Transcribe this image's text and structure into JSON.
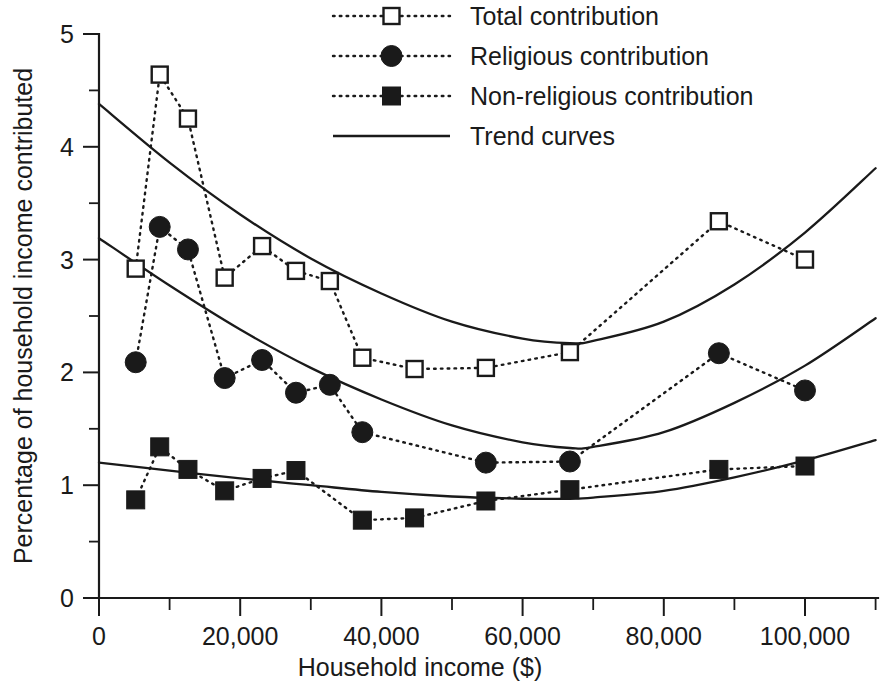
{
  "chart_data": {
    "type": "scatter",
    "title": "",
    "xlabel": "Household income ($)",
    "ylabel": "Percentage of household income contributed",
    "xlim": [
      0,
      110000
    ],
    "ylim": [
      0,
      5
    ],
    "xticks": [
      0,
      20000,
      40000,
      60000,
      80000,
      100000
    ],
    "xticklabels": [
      "0",
      "20,000",
      "40,000",
      "60,000",
      "80,000",
      "100,000"
    ],
    "xminor_step": 10000,
    "yticks": [
      0,
      1,
      2,
      3,
      4,
      5
    ],
    "yticklabels": [
      "0",
      "1",
      "2",
      "3",
      "4",
      "5"
    ],
    "yminor_step": 0.5,
    "grid": false,
    "legend_position": "top-right",
    "series": [
      {
        "name": "Total contribution",
        "marker": "open-square",
        "linestyle": "dotted",
        "x": [
          5200,
          8600,
          12600,
          17800,
          23100,
          27900,
          32700,
          37300,
          44700,
          54800,
          66700,
          87800,
          100000
        ],
        "y": [
          2.92,
          4.64,
          4.25,
          2.84,
          3.12,
          2.9,
          2.81,
          2.13,
          2.03,
          2.04,
          2.18,
          3.34,
          3.0
        ]
      },
      {
        "name": "Religious contribution",
        "marker": "filled-circle",
        "linestyle": "dotted",
        "x": [
          5200,
          8600,
          12600,
          17800,
          23100,
          27900,
          32700,
          37300,
          54800,
          66700,
          87800,
          100000
        ],
        "y": [
          2.09,
          3.29,
          3.09,
          1.95,
          2.11,
          1.82,
          1.89,
          1.47,
          1.2,
          1.21,
          2.17,
          1.84
        ]
      },
      {
        "name": "Non-religious contribution",
        "marker": "filled-square",
        "linestyle": "dotted",
        "x": [
          5200,
          8600,
          12600,
          17800,
          23100,
          27900,
          37300,
          44700,
          54800,
          66700,
          87800,
          100000
        ],
        "y": [
          0.87,
          1.34,
          1.14,
          0.95,
          1.06,
          1.13,
          0.69,
          0.71,
          0.86,
          0.96,
          1.14,
          1.17
        ]
      }
    ],
    "trend_curves": [
      {
        "name": "Total contribution trend",
        "points": [
          [
            0,
            4.38
          ],
          [
            10000,
            3.86
          ],
          [
            20000,
            3.4
          ],
          [
            30000,
            3.01
          ],
          [
            40000,
            2.7
          ],
          [
            50000,
            2.45
          ],
          [
            60000,
            2.3
          ],
          [
            66700,
            2.26
          ],
          [
            70000,
            2.28
          ],
          [
            80000,
            2.45
          ],
          [
            90000,
            2.78
          ],
          [
            100000,
            3.24
          ],
          [
            110000,
            3.81
          ]
        ]
      },
      {
        "name": "Religious contribution trend",
        "points": [
          [
            0,
            3.19
          ],
          [
            10000,
            2.77
          ],
          [
            20000,
            2.38
          ],
          [
            30000,
            2.04
          ],
          [
            40000,
            1.76
          ],
          [
            50000,
            1.53
          ],
          [
            60000,
            1.38
          ],
          [
            66700,
            1.33
          ],
          [
            70000,
            1.34
          ],
          [
            80000,
            1.47
          ],
          [
            90000,
            1.73
          ],
          [
            100000,
            2.06
          ],
          [
            110000,
            2.48
          ]
        ]
      },
      {
        "name": "Non-religious contribution trend",
        "points": [
          [
            0,
            1.2
          ],
          [
            10000,
            1.13
          ],
          [
            20000,
            1.06
          ],
          [
            30000,
            1.0
          ],
          [
            40000,
            0.94
          ],
          [
            50000,
            0.9
          ],
          [
            60000,
            0.88
          ],
          [
            66700,
            0.88
          ],
          [
            70000,
            0.89
          ],
          [
            80000,
            0.95
          ],
          [
            90000,
            1.07
          ],
          [
            100000,
            1.22
          ],
          [
            110000,
            1.4
          ]
        ]
      }
    ],
    "legend_entries": [
      {
        "label": "Total contribution",
        "marker": "open-square",
        "linestyle": "dotted"
      },
      {
        "label": "Religious contribution",
        "marker": "filled-circle",
        "linestyle": "dotted"
      },
      {
        "label": "Non-religious contribution",
        "marker": "filled-square",
        "linestyle": "dotted"
      },
      {
        "label": "Trend curves",
        "marker": "none",
        "linestyle": "solid"
      }
    ]
  },
  "axes": {
    "y_title": "Percentage of household income contributed",
    "x_title": "Household income ($)",
    "x_tick_labels": [
      "0",
      "20,000",
      "40,000",
      "60,000",
      "80,000",
      "100,000"
    ],
    "y_tick_labels": [
      "0",
      "1",
      "2",
      "3",
      "4",
      "5"
    ]
  },
  "legend": {
    "items": [
      {
        "label": "Total contribution"
      },
      {
        "label": "Religious contribution"
      },
      {
        "label": "Non-religious contribution"
      },
      {
        "label": "Trend curves"
      }
    ]
  }
}
